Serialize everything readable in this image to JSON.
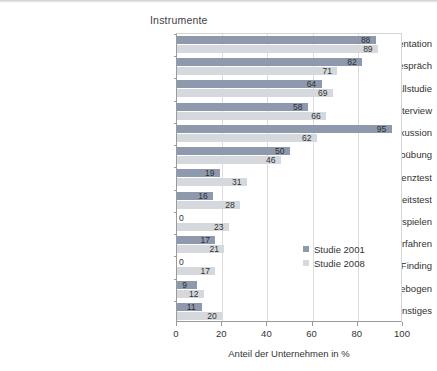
{
  "chart_data": {
    "type": "bar",
    "orientation": "horizontal",
    "title": "Instrumente",
    "xlabel": "Anteil der Unternehmen in %",
    "ylabel": "",
    "xlim": [
      0,
      100
    ],
    "xticks": [
      "0",
      "20",
      "40",
      "60",
      "80",
      "100"
    ],
    "grid": "vertical",
    "legend_position": "inside-right",
    "categories": [
      "Präsentation",
      "Zweiergespräch",
      "Fallstudie",
      "Interview",
      "Gruppendiskussion",
      "Postkorbübung",
      "Intelligenztest",
      "Persönlichkeitstest",
      "Gruppenübung mit Rollenspielen",
      "Computergestützte Verfahren",
      "Fact Finding",
      "Biographischer Fragebogen",
      "Sonstiges"
    ],
    "series": [
      {
        "name": "Studie 2001",
        "color": "#8f99ad",
        "values": [
          88,
          82,
          64,
          58,
          95,
          50,
          19,
          16,
          0,
          17,
          0,
          9,
          11
        ]
      },
      {
        "name": "Studie 2008",
        "color": "#d5d8dd",
        "values": [
          89,
          71,
          69,
          66,
          62,
          46,
          31,
          28,
          23,
          21,
          17,
          12,
          20
        ]
      }
    ]
  },
  "colors": {
    "series_2001": "#8f99ad",
    "series_2008": "#d5d8dd",
    "axis": "#9a9a9a",
    "grid": "#dcdcdc",
    "text": "#333333",
    "background": "#ffffff"
  }
}
